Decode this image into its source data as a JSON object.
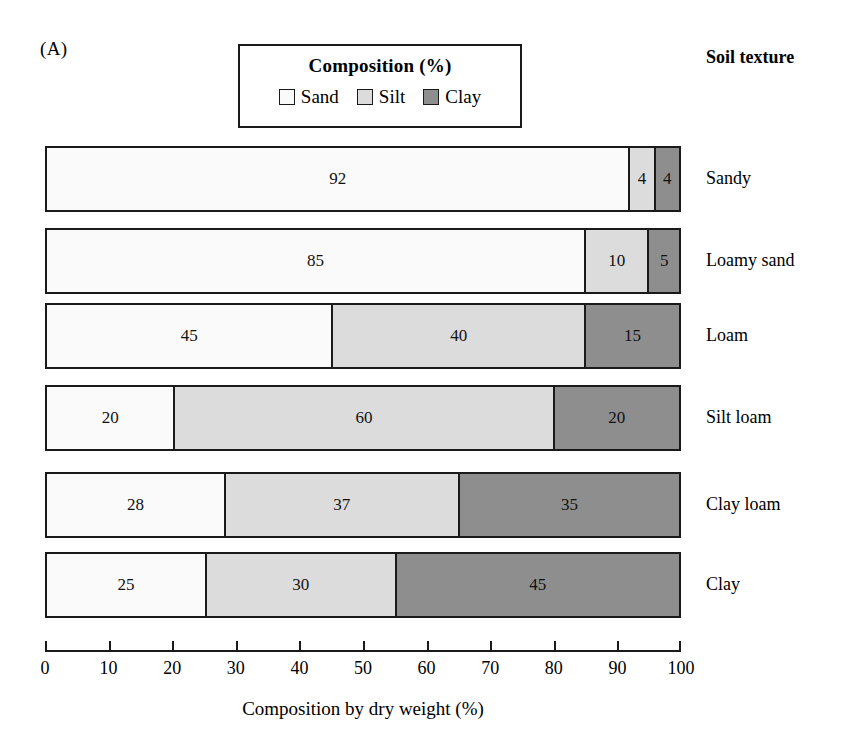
{
  "figure": {
    "panel_label": "(A)",
    "column_header": "Soil texture"
  },
  "legend": {
    "title": "Composition (%)",
    "items": [
      {
        "label": "Sand",
        "color": "#fafafa",
        "key": "sand"
      },
      {
        "label": "Silt",
        "color": "#dcdcdc",
        "key": "silt"
      },
      {
        "label": "Clay",
        "color": "#8e8e8e",
        "key": "clay"
      }
    ]
  },
  "axis": {
    "title": "Composition by dry weight (%)",
    "ticks": [
      "0",
      "10",
      "20",
      "30",
      "40",
      "50",
      "60",
      "70",
      "80",
      "90",
      "100"
    ],
    "min": 0,
    "max": 100
  },
  "chart_data": {
    "type": "bar",
    "orientation": "horizontal",
    "stacked": true,
    "title": "Composition (%)",
    "xlabel": "Composition by dry weight (%)",
    "ylabel": "Soil texture",
    "xlim": [
      0,
      100
    ],
    "xticks": [
      0,
      10,
      20,
      30,
      40,
      50,
      60,
      70,
      80,
      90,
      100
    ],
    "grid": false,
    "legend_position": "top-center",
    "categories": [
      "Sandy",
      "Loamy sand",
      "Loam",
      "Silt loam",
      "Clay loam",
      "Clay"
    ],
    "series": [
      {
        "name": "Sand",
        "color": "#fafafa",
        "values": [
          92,
          85,
          45,
          20,
          28,
          25
        ]
      },
      {
        "name": "Silt",
        "color": "#dcdcdc",
        "values": [
          4,
          10,
          40,
          60,
          37,
          30
        ]
      },
      {
        "name": "Clay",
        "color": "#8e8e8e",
        "values": [
          4,
          5,
          15,
          20,
          35,
          45
        ]
      }
    ],
    "rows": [
      {
        "category": "Sandy",
        "sand": 92,
        "silt": 4,
        "clay": 4,
        "top": 6
      },
      {
        "category": "Loamy sand",
        "sand": 85,
        "silt": 10,
        "clay": 5,
        "top": 88
      },
      {
        "category": "Loam",
        "sand": 45,
        "silt": 40,
        "clay": 15,
        "top": 163
      },
      {
        "category": "Silt loam",
        "sand": 20,
        "silt": 60,
        "clay": 20,
        "top": 245
      },
      {
        "category": "Clay loam",
        "sand": 28,
        "silt": 37,
        "clay": 35,
        "top": 332
      },
      {
        "category": "Clay",
        "sand": 25,
        "silt": 30,
        "clay": 45,
        "top": 412
      }
    ]
  }
}
